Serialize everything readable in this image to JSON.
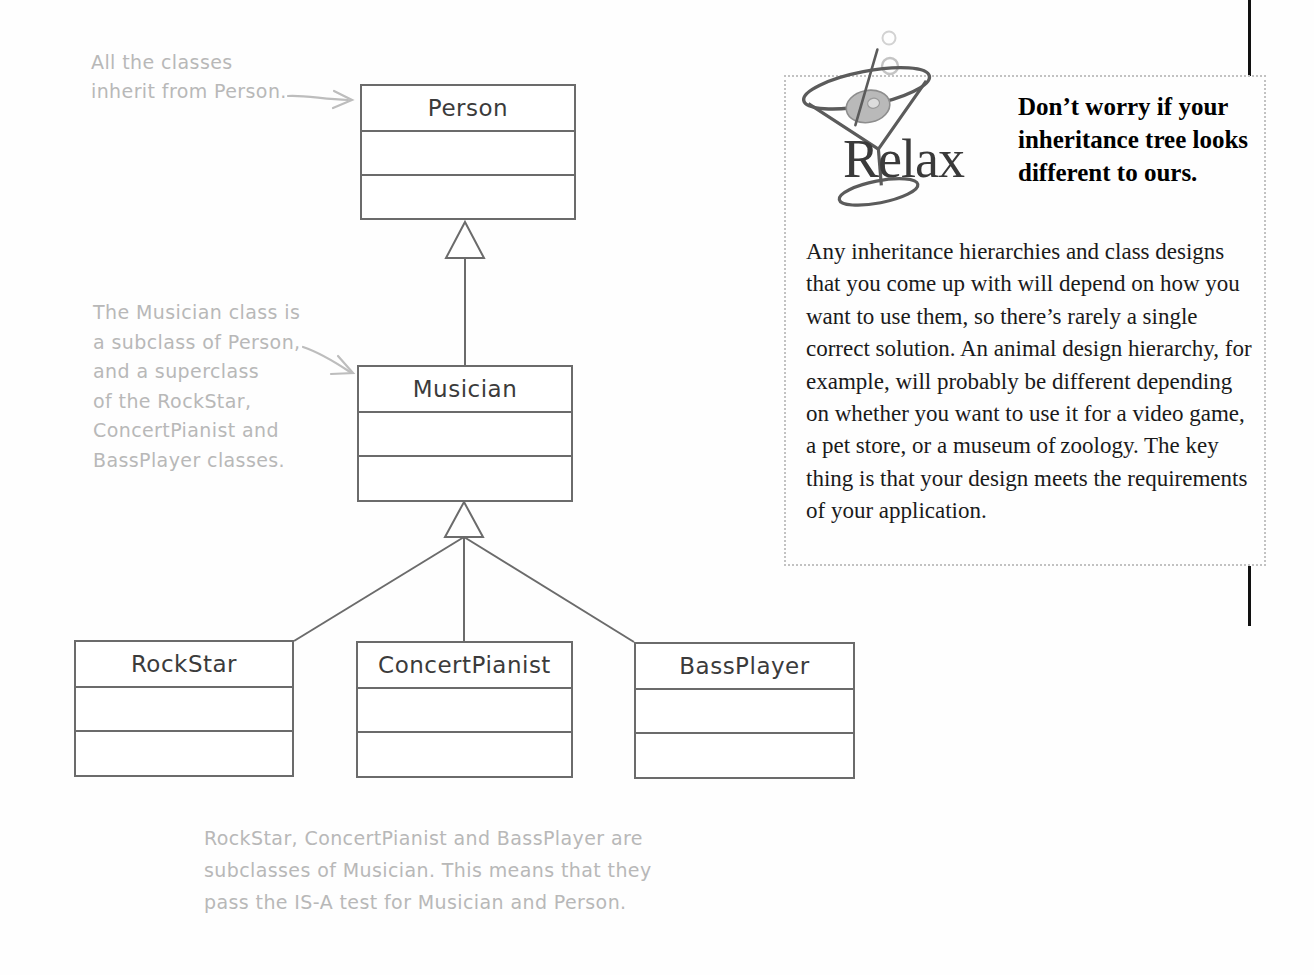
{
  "diagram": {
    "classes": [
      {
        "id": "person",
        "name": "Person",
        "level": 0
      },
      {
        "id": "musician",
        "name": "Musician",
        "level": 1
      },
      {
        "id": "rockstar",
        "name": "RockStar",
        "level": 2
      },
      {
        "id": "concertpianist",
        "name": "ConcertPianist",
        "level": 2
      },
      {
        "id": "bassplayer",
        "name": "BassPlayer",
        "level": 2
      }
    ],
    "relationships": [
      {
        "from": "musician",
        "to": "person",
        "type": "inheritance"
      },
      {
        "from": "rockstar",
        "to": "musician",
        "type": "inheritance"
      },
      {
        "from": "concertpianist",
        "to": "musician",
        "type": "inheritance"
      },
      {
        "from": "bassplayer",
        "to": "musician",
        "type": "inheritance"
      }
    ],
    "annotations": {
      "top_left": "All the classes\ninherit from Person.",
      "mid_left": "The Musician class is\na subclass of Person,\nand a superclass\nof the RockStar,\nConcertPianist and\nBassPlayer classes.",
      "bottom": "RockStar, ConcertPianist and BassPlayer are\nsubclasses of Musician. This means that they\npass the IS-A test for Musician and Person."
    }
  },
  "relax": {
    "label": "Relax",
    "heading": "Don’t worry if your inheritance tree looks different to ours.",
    "body": "Any inheritance hierarchies and class designs that you come up with will depend on how you want to use them, so there’s rarely a single correct solution. An animal design hierarchy, for example, will probably be different depending on whether you want to use it for a video game, a pet store, or a museum of zoology. The key thing is that your design meets the requirements of your application.",
    "icon": "martini-glass-icon"
  },
  "colors": {
    "box_stroke": "#6b6b6b",
    "handwriting": "#b8b8b8",
    "dotted_border": "#c2c2c2",
    "rule": "#111111",
    "text": "#1a1a1a"
  }
}
